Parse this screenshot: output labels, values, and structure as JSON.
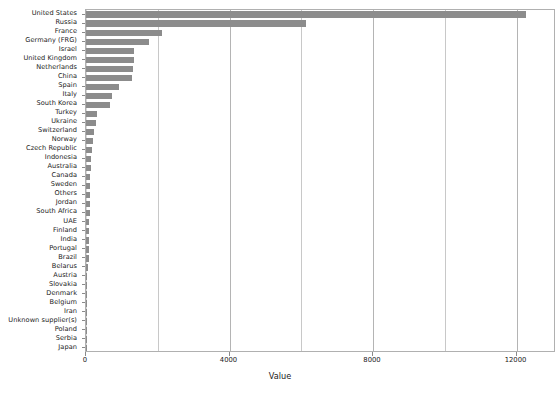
{
  "chart_data": {
    "type": "bar",
    "orientation": "horizontal",
    "title": "",
    "xlabel": "Value",
    "ylabel": "",
    "xlim": [
      0,
      13100
    ],
    "xticks": [
      0,
      4000,
      8000,
      12000
    ],
    "xtick_labels": [
      "0",
      "4000",
      "8000",
      "12000"
    ],
    "minor_gridlines": [
      2000,
      6000,
      10000
    ],
    "grid": true,
    "legend": "none",
    "bar_color": "#8c8c8c",
    "categories": [
      "United States",
      "Russia",
      "France",
      "Germany (FRG)",
      "Israel",
      "United Kingdom",
      "Netherlands",
      "China",
      "Spain",
      "Italy",
      "South Korea",
      "Turkey",
      "Ukraine",
      "Switzerland",
      "Norway",
      "Czech Republic",
      "Indonesia",
      "Australia",
      "Canada",
      "Sweden",
      "Others",
      "Jordan",
      "South Africa",
      "UAE",
      "Finland",
      "India",
      "Portugal",
      "Brazil",
      "Belarus",
      "Austria",
      "Slovakia",
      "Denmark",
      "Belgium",
      "Iran",
      "Unknown supplier(s)",
      "Poland",
      "Serbia",
      "Japan"
    ],
    "values": [
      12270,
      6120,
      2120,
      1760,
      1330,
      1330,
      1310,
      1290,
      930,
      720,
      680,
      300,
      290,
      230,
      190,
      160,
      140,
      130,
      120,
      115,
      110,
      105,
      100,
      95,
      90,
      85,
      80,
      75,
      45,
      40,
      38,
      35,
      32,
      28,
      25,
      22,
      18,
      15
    ]
  }
}
